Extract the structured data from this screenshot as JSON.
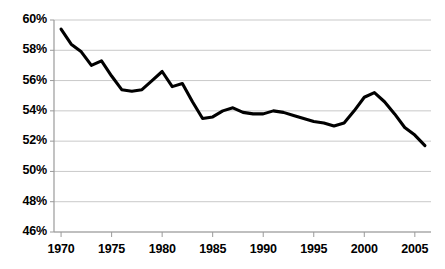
{
  "chart_data": {
    "type": "line",
    "title": "",
    "subtitle": "",
    "xlabel": "",
    "ylabel": "",
    "xlim": [
      1969.3,
      2006.6
    ],
    "ylim": [
      46,
      60
    ],
    "ytick_labels": [
      "60%",
      "58%",
      "56%",
      "54%",
      "52%",
      "50%",
      "48%",
      "46%"
    ],
    "ytick_values": [
      60,
      58,
      56,
      54,
      52,
      50,
      48,
      46
    ],
    "xtick_labels": [
      "1970",
      "1975",
      "1980",
      "1985",
      "1990",
      "1995",
      "2000",
      "2005"
    ],
    "xtick_values": [
      1970,
      1975,
      1980,
      1985,
      1990,
      1995,
      2000,
      2005
    ],
    "grid": true,
    "grid_axis": "y",
    "legend": false,
    "legend_position": "none",
    "line_color": "#000000",
    "line_width": 3.1,
    "grid_color": "#c9c9c9",
    "axis_color": "#9a9a9a",
    "background": "#ffffff",
    "x": [
      1970,
      1971,
      1972,
      1973,
      1974,
      1975,
      1976,
      1977,
      1978,
      1979,
      1980,
      1981,
      1982,
      1983,
      1984,
      1985,
      1986,
      1987,
      1988,
      1989,
      1990,
      1991,
      1992,
      1993,
      1994,
      1995,
      1996,
      1997,
      1998,
      1999,
      2000,
      2001,
      2002,
      2003,
      2004,
      2005,
      2006
    ],
    "values": [
      59.4,
      58.4,
      57.9,
      57.0,
      57.3,
      56.3,
      55.4,
      55.3,
      55.4,
      56.0,
      56.6,
      55.6,
      55.8,
      54.6,
      53.5,
      53.6,
      54.0,
      54.2,
      53.9,
      53.8,
      53.8,
      54.0,
      53.9,
      53.7,
      53.5,
      53.3,
      53.2,
      53.0,
      53.2,
      54.0,
      54.9,
      55.2,
      54.6,
      53.8,
      52.9,
      52.4,
      51.7
    ],
    "series": [
      {
        "name": "series-1",
        "values": [
          59.4,
          58.4,
          57.9,
          57.0,
          57.3,
          56.3,
          55.4,
          55.3,
          55.4,
          56.0,
          56.6,
          55.6,
          55.8,
          54.6,
          53.5,
          53.6,
          54.0,
          54.2,
          53.9,
          53.8,
          53.8,
          54.0,
          53.9,
          53.7,
          53.5,
          53.3,
          53.2,
          53.0,
          53.2,
          54.0,
          54.9,
          55.2,
          54.6,
          53.8,
          52.9,
          52.4,
          51.7
        ]
      }
    ]
  }
}
